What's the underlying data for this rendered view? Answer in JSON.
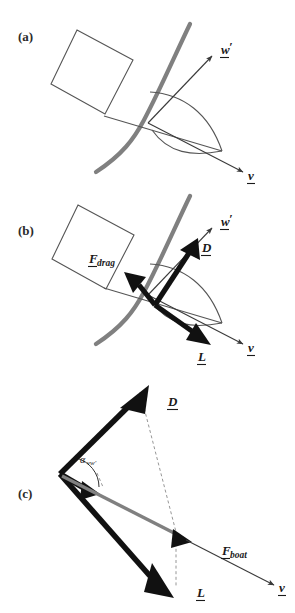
{
  "figure": {
    "type": "diagram",
    "width": 295,
    "height": 613,
    "background": "#ffffff"
  },
  "colors": {
    "sail_gray": "#808080",
    "hull_outline": "#555555",
    "vector_black": "#111111",
    "dashed_gray": "#8a8a8a",
    "text": "#1a1a1a"
  },
  "panels": [
    {
      "id": "a",
      "label": "(a)",
      "caption_position": {
        "x": 22,
        "y": 38
      },
      "elements": [
        "hull-rectangle",
        "sail-curve-gray",
        "sail-lens-outline",
        "chord-line",
        "apparent-wind-arrow",
        "boat-velocity-arrow"
      ],
      "vectors": [
        {
          "name": "w-prime",
          "label": "w",
          "prime": "′",
          "underlined": true,
          "style": "thin",
          "color": "#3a3a3a"
        },
        {
          "name": "v",
          "label": "v",
          "prime": "",
          "underlined": true,
          "style": "thin",
          "color": "#3a3a3a"
        }
      ]
    },
    {
      "id": "b",
      "label": "(b)",
      "caption_position": {
        "x": 22,
        "y": 230
      },
      "elements": [
        "hull-rectangle",
        "sail-curve-gray",
        "sail-lens-outline",
        "chord-line",
        "apparent-wind-arrow",
        "boat-velocity-arrow",
        "drag-vector",
        "lift-vector",
        "D-vector"
      ],
      "vectors": [
        {
          "name": "w-prime",
          "label": "w",
          "prime": "′",
          "underlined": true,
          "style": "thin",
          "color": "#3a3a3a"
        },
        {
          "name": "v",
          "label": "v",
          "prime": "",
          "underlined": true,
          "style": "thin",
          "color": "#3a3a3a"
        },
        {
          "name": "D",
          "label": "D",
          "prime": "",
          "underlined": true,
          "style": "thick",
          "color": "#111111"
        },
        {
          "name": "L",
          "label": "L",
          "prime": "",
          "underlined": true,
          "style": "thick",
          "color": "#111111"
        },
        {
          "name": "F-drag",
          "label": "F",
          "subscript": "drag",
          "underlined": true,
          "style": "thick",
          "color": "#111111"
        }
      ]
    },
    {
      "id": "c",
      "label": "(c)",
      "caption_position": {
        "x": 22,
        "y": 493
      },
      "elements": [
        "D-vector",
        "L-vector",
        "F-boat-gray-vector",
        "w-prime-short-arrow",
        "v-thin-arrow",
        "angle-arc",
        "dashed-construction-lines"
      ],
      "vectors": [
        {
          "name": "D",
          "label": "D",
          "prime": "",
          "underlined": true,
          "style": "thick",
          "color": "#111111"
        },
        {
          "name": "L",
          "label": "L",
          "prime": "",
          "underlined": true,
          "style": "thick",
          "color": "#111111"
        },
        {
          "name": "F-boat",
          "label": "F",
          "subscript": "boat",
          "underlined": true,
          "style": "gray",
          "color": "#808080"
        },
        {
          "name": "v",
          "label": "v",
          "prime": "",
          "underlined": true,
          "style": "thin",
          "color": "#3a3a3a"
        }
      ],
      "angle": {
        "name": "alpha-vw-prime",
        "symbol": "α",
        "subscript": "vw′"
      }
    }
  ],
  "labels": {
    "panel_a": "(a)",
    "panel_b": "(b)",
    "panel_c": "(c)",
    "w_prime": "w",
    "w_prime_mark": "′",
    "v": "v",
    "D": "D",
    "L": "L",
    "F": "F",
    "drag_sub": "drag",
    "boat_sub": "boat",
    "alpha": "α",
    "alpha_sub": "vw′"
  }
}
